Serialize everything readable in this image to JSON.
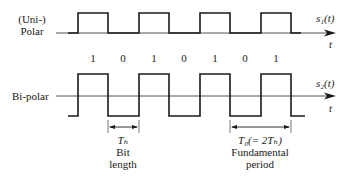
{
  "diagram": {
    "top_signal": {
      "label_line1": "(Uni-)",
      "label_line2": "Polar",
      "signal_name": "s₁(t)",
      "axis_label": "t"
    },
    "bits": [
      "1",
      "0",
      "1",
      "0",
      "1",
      "0",
      "1"
    ],
    "bottom_signal": {
      "label": "Bi-polar",
      "signal_name": "s₂(t)",
      "axis_label": "t"
    },
    "annotations": {
      "bit_length_symbol": "Tₕ",
      "bit_length_line1": "Bit",
      "bit_length_line2": "length",
      "period_symbol": "T₀(= 2Tₕ)",
      "period_line1": "Fundamental",
      "period_line2": "period"
    },
    "colors": {
      "stroke": "#1a1a1a",
      "axis": "#555555"
    }
  }
}
